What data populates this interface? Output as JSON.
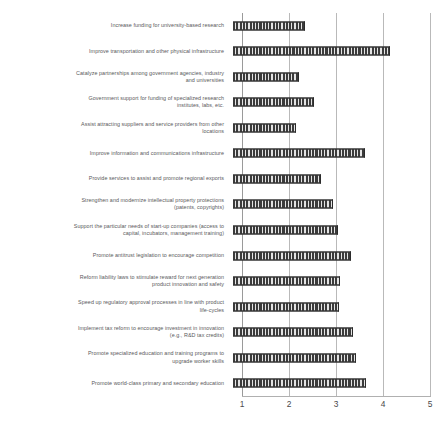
{
  "chart_data": {
    "type": "bar",
    "orientation": "horizontal",
    "title": "",
    "subtitle": "",
    "xlabel": "",
    "ylabel": "",
    "xlim": [
      1,
      5
    ],
    "xticks": [
      1,
      2,
      3,
      4,
      5
    ],
    "xtick_labels": [
      "1",
      "2",
      "3",
      "4",
      "5"
    ],
    "grid": true,
    "grid_axis": "x",
    "legend": false,
    "legend_position": "none",
    "bar_color": "#3b3b3b",
    "bar_pattern": "vertical-hatch",
    "categories": [
      "Increase funding for university-based research",
      "Improve transportation and other physical infrastructure",
      "Catalyze partnerships among government agencies, industry\nand universities",
      "Government support for funding of specialized research\ninstitutes, labs, etc.",
      "Assist attracting suppliers and service providers from other\nlocations",
      "Improve information and communications infrastructure",
      "Provide services to assist and promote regional exports",
      "Strengthen and modernize intellectual property protections\n(patents, copyrights)",
      "Support the particular needs of start-up companies (access to\ncapital, incubators, management training)",
      "Promote antitrust legislation to encourage competition",
      "Reform liability laws to stimulate reward for next generation\nproduct innovation and safety",
      "Speed up regulatory approval processes in line with product\nlife-cycles",
      "Implement tax reform to encourage investment in innovation\n(e.g., R&D tax credits)",
      "Promote specialized education and training programs to\nupgrade worker skills",
      "Promote world-class primary and secondary education"
    ],
    "values": [
      2.53,
      4.34,
      2.4,
      2.73,
      2.34,
      3.81,
      2.87,
      3.13,
      3.23,
      3.51,
      3.28,
      3.26,
      3.55,
      3.62,
      3.83
    ]
  }
}
